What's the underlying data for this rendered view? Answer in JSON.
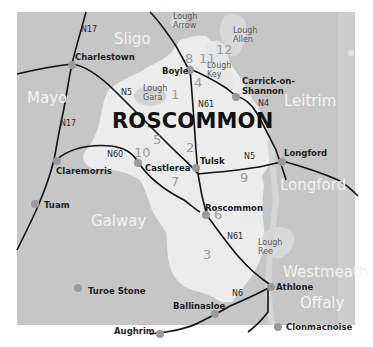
{
  "map": {
    "title": "ROSCOMMON",
    "colors": {
      "background": "#ffffff",
      "surrounding_counties": "#c6c6c6",
      "roscommon_county": "#ececec",
      "lakes": "#d9d9d9",
      "roads": "#111111",
      "town_dots": "#9a9a9a",
      "county_labels": "#f4f4f4",
      "site_numbers": "#9a9a9a"
    },
    "counties": [
      {
        "name": "Sligo"
      },
      {
        "name": "Mayo"
      },
      {
        "name": "Leitrim"
      },
      {
        "name": "Longford"
      },
      {
        "name": "Galway"
      },
      {
        "name": "Westmeath"
      },
      {
        "name": "Offaly"
      }
    ],
    "towns": [
      {
        "name": "Charlestown"
      },
      {
        "name": "Boyle"
      },
      {
        "name": "Carrick-on-Shannon",
        "line1": "Carrick-on-",
        "line2": "Shannon"
      },
      {
        "name": "Claremorris"
      },
      {
        "name": "Castlerea"
      },
      {
        "name": "Tulsk"
      },
      {
        "name": "Longford"
      },
      {
        "name": "Tuam"
      },
      {
        "name": "Roscommon"
      },
      {
        "name": "Turoe Stone"
      },
      {
        "name": "Ballinasloe"
      },
      {
        "name": "Athlone"
      },
      {
        "name": "Aughrim"
      },
      {
        "name": "Clonmacnoise"
      }
    ],
    "lakes": [
      {
        "line1": "Lough",
        "line2": "Arrow"
      },
      {
        "line1": "Lough",
        "line2": "Allen"
      },
      {
        "line1": "Lough",
        "line2": "Key"
      },
      {
        "line1": "Lough",
        "line2": "Gara"
      },
      {
        "line1": "Lough",
        "line2": "Ree"
      }
    ],
    "roads": [
      "N17",
      "N5",
      "N61",
      "N4",
      "N60",
      "N5",
      "N17",
      "N61",
      "N6"
    ],
    "site_numbers": [
      "8",
      "11",
      "12",
      "4",
      "1",
      "5",
      "10",
      "2",
      "7",
      "9",
      "6",
      "3"
    ]
  }
}
